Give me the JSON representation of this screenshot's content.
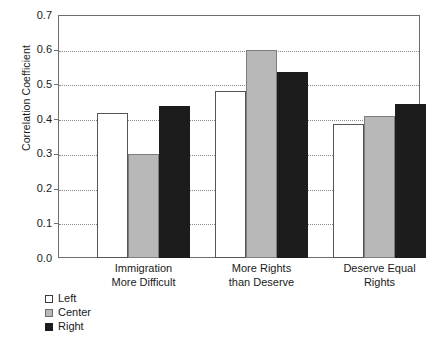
{
  "chart_data": {
    "type": "bar",
    "title": "",
    "xlabel": "",
    "ylabel": "Correlation Coefficient",
    "categories": [
      "Immigration\nMore Difficult",
      "More Rights\nthan Deserve",
      "Deserve Equal\nRights"
    ],
    "category_lines": [
      [
        "Immigration",
        "More Difficult"
      ],
      [
        "More Rights",
        "than Deserve"
      ],
      [
        "Deserve Equal",
        "Rights"
      ]
    ],
    "series": [
      {
        "name": "Left",
        "color": "#ffffff",
        "values": [
          0.418,
          0.48,
          0.385
        ]
      },
      {
        "name": "Center",
        "color": "#b8b8b8",
        "values": [
          0.299,
          0.6,
          0.408
        ]
      },
      {
        "name": "Right",
        "color": "#1c1c1c",
        "values": [
          0.438,
          0.535,
          0.443
        ]
      }
    ],
    "ylim": [
      0.0,
      0.7
    ],
    "ytick_values": [
      0.0,
      0.1,
      0.2,
      0.3,
      0.4,
      0.5,
      0.6,
      0.7
    ],
    "ytick_labels": [
      "0.0",
      "0.1",
      "0.2",
      "0.3",
      "0.4",
      "0.5",
      "0.6",
      "0.7"
    ],
    "grid": "horizontal-dotted",
    "legend_position": "below-left",
    "legend_entries": [
      "Left",
      "Center",
      "Right"
    ]
  },
  "axis": {
    "y_title": "Correlation Coefficient"
  },
  "colors": {
    "left": "#ffffff",
    "center": "#b8b8b8",
    "right": "#1c1c1c",
    "frame": "#6e6e6e",
    "grid": "#8a8a8a"
  }
}
